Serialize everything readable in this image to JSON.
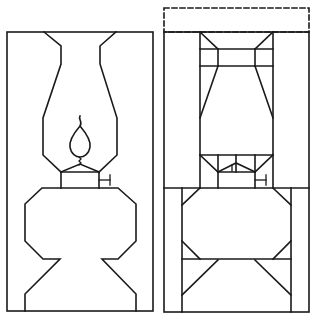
{
  "figure": {
    "stroke_color": "#1a1a1a",
    "background_color": "#ffffff",
    "panels": [
      {
        "id": "left",
        "label": "lamp-outline",
        "parts": [
          "frame",
          "chimney",
          "flame",
          "wick",
          "burner",
          "knob",
          "font-base"
        ]
      },
      {
        "id": "right",
        "label": "lamp-segmented",
        "parts": [
          "dashed-top-extension",
          "frame",
          "chimney-column",
          "burner-section",
          "knob",
          "base-section"
        ]
      }
    ]
  }
}
